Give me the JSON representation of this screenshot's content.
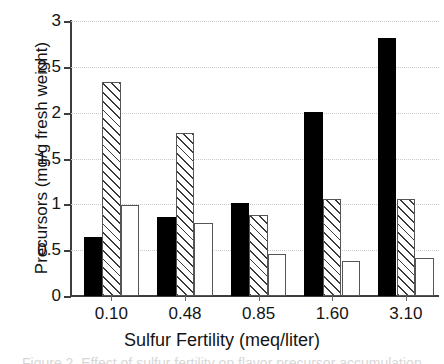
{
  "chart_data": {
    "type": "bar",
    "title": "",
    "subtitle": "",
    "xlabel": "Sulfur Fertility (meq/liter)",
    "ylabel": "Precursors (mg/g fresh weight)",
    "categories": [
      "0.10",
      "0.48",
      "0.85",
      "1.60",
      "3.10"
    ],
    "ylim": [
      0,
      3
    ],
    "yticks": [
      0,
      0.5,
      1,
      1.5,
      2,
      2.5,
      3
    ],
    "ytick_labels": [
      "0",
      "0.5",
      "1",
      "1.5",
      "2",
      "2.5",
      "3"
    ],
    "grid": "horizontal-dotted",
    "legend": "none",
    "series": [
      {
        "name": "series-1",
        "pattern": "solid-black",
        "values": [
          0.64,
          0.86,
          1.01,
          2.01,
          2.81
        ]
      },
      {
        "name": "series-2",
        "pattern": "diagonal-hatch",
        "values": [
          2.33,
          1.78,
          0.88,
          1.06,
          1.06
        ]
      },
      {
        "name": "series-3",
        "pattern": "dotted-stipple",
        "values": [
          0.99,
          0.8,
          0.46,
          0.38,
          0.42
        ]
      }
    ],
    "colors": {
      "solid-black": "#000000",
      "hatch-line": "#3a3a3a",
      "dot-fill": "#9a9a9a",
      "axis": "#3d3d3d",
      "gridline": "#c9c9c9",
      "text": "#141414",
      "background": "#ffffff"
    }
  },
  "axes": {
    "y_title": "Precursors (mg/g fresh weight)",
    "x_title": "Sulfur Fertility (meq/liter)"
  },
  "caption": {
    "clipped_line": "Figure 2. Effect of sulfur fertility on flavor precursor accumulation in onion"
  }
}
